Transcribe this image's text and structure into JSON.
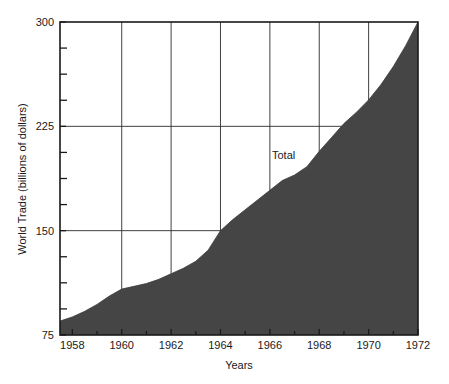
{
  "chart_data": {
    "type": "area",
    "title": "",
    "subtitle": "",
    "xlabel": "Years",
    "ylabel": "World Trade (billions of dollars)",
    "xlim": [
      1957.5,
      1972
    ],
    "ylim": [
      75,
      300
    ],
    "grid": true,
    "legend_position": "inline-annotation",
    "series": [
      {
        "name": "Total",
        "annotation": "Total",
        "annotation_x": 1966.0,
        "annotation_y": 201,
        "color": "#454545",
        "x": [
          1957.5,
          1958.0,
          1958.5,
          1959.0,
          1959.5,
          1960.0,
          1960.5,
          1961.0,
          1961.5,
          1962.0,
          1962.5,
          1963.0,
          1963.5,
          1964.0,
          1964.5,
          1965.0,
          1965.5,
          1966.0,
          1966.5,
          1967.0,
          1967.5,
          1968.0,
          1968.5,
          1969.0,
          1969.5,
          1970.0,
          1970.5,
          1971.0,
          1971.5,
          1972.0
        ],
        "y": [
          85,
          88,
          92,
          97,
          103,
          108,
          110,
          112,
          115,
          119,
          123,
          128,
          136,
          150,
          158,
          165,
          172,
          179,
          186,
          190,
          196,
          207,
          217,
          227,
          235,
          244,
          255,
          268,
          283,
          300
        ]
      }
    ],
    "x_major_ticks": [
      1958,
      1960,
      1962,
      1964,
      1966,
      1968,
      1970,
      1972
    ],
    "x_major_tick_labels": [
      "1958",
      "1960",
      "1962",
      "1964",
      "1966",
      "1968",
      "1970",
      "1972"
    ],
    "x_minor_ticks": [
      1959,
      1961,
      1963,
      1965,
      1967,
      1969,
      1971
    ],
    "x_gridlines": [
      1960,
      1962,
      1964,
      1966,
      1968,
      1970
    ],
    "y_major_ticks": [
      75,
      150,
      225,
      300
    ],
    "y_major_tick_labels": [
      "75",
      "150",
      "225",
      "300"
    ],
    "y_minor_ticks": [
      93.75,
      112.5,
      131.25,
      168.75,
      187.5,
      206.25,
      243.75,
      262.5,
      281.25
    ],
    "y_gridlines": [
      150,
      225
    ],
    "colors": {
      "area_fill": "#454545",
      "frame": "#1a1a1a",
      "grid": "#2b2b2b",
      "text": "#1a1a1a",
      "background": "#ffffff"
    }
  }
}
